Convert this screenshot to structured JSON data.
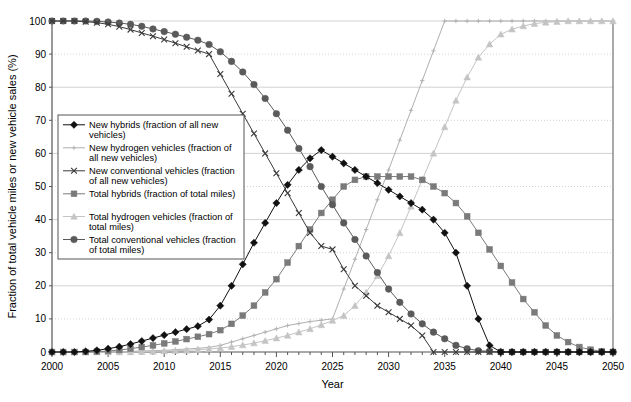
{
  "chart_data": {
    "type": "line",
    "title": "",
    "xlabel": "Year",
    "ylabel": "Fraction of total vehicle miles or new vehicle sales (%)",
    "xlim": [
      2000,
      2050
    ],
    "ylim": [
      0,
      100
    ],
    "xticks": [
      2000,
      2005,
      2010,
      2015,
      2020,
      2025,
      2030,
      2035,
      2040,
      2045,
      2050
    ],
    "yticks": [
      0,
      10,
      20,
      30,
      40,
      50,
      60,
      70,
      80,
      90,
      100
    ],
    "grid": true,
    "legend_position": "upper-left-inside",
    "x": [
      2000,
      2001,
      2002,
      2003,
      2004,
      2005,
      2006,
      2007,
      2008,
      2009,
      2010,
      2011,
      2012,
      2013,
      2014,
      2015,
      2016,
      2017,
      2018,
      2019,
      2020,
      2021,
      2022,
      2023,
      2024,
      2025,
      2026,
      2027,
      2028,
      2029,
      2030,
      2031,
      2032,
      2033,
      2034,
      2035,
      2036,
      2037,
      2038,
      2039,
      2040,
      2041,
      2042,
      2043,
      2044,
      2045,
      2046,
      2047,
      2048,
      2049,
      2050
    ],
    "series": [
      {
        "name": "New hybrids (fraction of all new vehicles)",
        "key": "new_hybrids",
        "marker": "diamond",
        "color": "#111111",
        "values": [
          0,
          0,
          0,
          0.2,
          0.5,
          1,
          1.6,
          2.4,
          3.3,
          4.2,
          5.1,
          6,
          6.9,
          7.8,
          9.8,
          14,
          20,
          26.5,
          33,
          39,
          45,
          50.5,
          55,
          58.5,
          61,
          59,
          57,
          55,
          53,
          51,
          49,
          47,
          45,
          43,
          40,
          36,
          30,
          20,
          10,
          2,
          0,
          0,
          0,
          0,
          0,
          0,
          0,
          0,
          0,
          0,
          0
        ]
      },
      {
        "name": "New hydrogen vehicles (fraction of all new vehicles)",
        "key": "new_hydrogen",
        "marker": "dot",
        "color": "#b0b0b0",
        "values": [
          0,
          0,
          0,
          0,
          0,
          0,
          0.1,
          0.2,
          0.3,
          0.4,
          0.5,
          0.7,
          0.9,
          1.1,
          1.4,
          2,
          3,
          4,
          5,
          6,
          7,
          8,
          8.6,
          9.2,
          9.6,
          10,
          19,
          28,
          37,
          46,
          55,
          64,
          73,
          82,
          91,
          100,
          100,
          100,
          100,
          100,
          100,
          100,
          100,
          100,
          100,
          100,
          100,
          100,
          100,
          100,
          100
        ]
      },
      {
        "name": "New conventional vehicles (fraction of all new vehicles)",
        "key": "new_conventional",
        "marker": "x",
        "color": "#3a3a3a",
        "values": [
          100,
          100,
          100,
          99.8,
          99.5,
          99,
          98.3,
          97.4,
          96.4,
          95.4,
          94.4,
          93.3,
          92.2,
          91.1,
          90,
          84,
          78,
          72,
          66,
          60,
          54,
          48,
          42,
          36,
          32,
          31,
          25,
          20,
          17,
          14,
          12,
          10,
          8,
          5,
          0,
          0,
          0,
          0,
          0,
          0,
          0,
          0,
          0,
          0,
          0,
          0,
          0,
          0,
          0,
          0,
          0
        ]
      },
      {
        "name": "Total hybrids (fraction of total miles)",
        "key": "total_hybrids",
        "marker": "square",
        "color": "#7a7a7a",
        "values": [
          0,
          0,
          0,
          0,
          0.1,
          0.3,
          0.6,
          1,
          1.5,
          2,
          2.6,
          3.2,
          3.9,
          4.6,
          5.4,
          6.6,
          8.5,
          11,
          14,
          18,
          22,
          27,
          32,
          37,
          42,
          46,
          50,
          52,
          53,
          53,
          53,
          53,
          53,
          52,
          50,
          48,
          45,
          41,
          36,
          31,
          26,
          21,
          16,
          12,
          8,
          5,
          3,
          1.5,
          0.7,
          0.2,
          0
        ]
      },
      {
        "name": "Total hydrogen vehicles (fraction of total miles)",
        "key": "total_hydrogen",
        "marker": "triangle",
        "color": "#c4c4c4",
        "values": [
          0,
          0,
          0,
          0,
          0,
          0,
          0,
          0,
          0.1,
          0.2,
          0.3,
          0.4,
          0.5,
          0.7,
          0.9,
          1.2,
          1.6,
          2.1,
          2.7,
          3.4,
          4.2,
          5,
          6,
          7,
          8.2,
          9.5,
          11,
          14,
          18,
          23,
          29,
          36,
          44,
          52,
          60,
          68,
          76,
          83,
          89,
          93,
          96,
          97.5,
          98.5,
          99.2,
          99.6,
          99.8,
          100,
          100,
          100,
          100,
          100
        ]
      },
      {
        "name": "Total conventional vehicles (fraction of total miles)",
        "key": "total_conventional",
        "marker": "circle",
        "color": "#5a5a5a",
        "values": [
          100,
          100,
          100,
          100,
          99.9,
          99.7,
          99.4,
          99,
          98.4,
          97.6,
          96.8,
          96,
          95.1,
          94.2,
          92.9,
          90.7,
          87.8,
          84.6,
          80.8,
          76.6,
          72,
          67,
          61.5,
          56,
          50,
          44.5,
          39,
          34,
          29,
          24,
          19,
          15,
          11.5,
          8.5,
          6,
          4,
          2,
          1,
          0.4,
          0.2,
          0,
          0,
          0,
          0,
          0,
          0,
          0,
          0,
          0,
          0,
          0
        ]
      }
    ]
  },
  "axes": {
    "y_title": "Fraction of total vehicle miles or new vehicle sales (%)",
    "x_title": "Year",
    "y_tick_labels": [
      "0",
      "10",
      "20",
      "30",
      "40",
      "50",
      "60",
      "70",
      "80",
      "90",
      "100"
    ],
    "x_tick_labels": [
      "2000",
      "2005",
      "2010",
      "2015",
      "2020",
      "2025",
      "2030",
      "2035",
      "2040",
      "2045",
      "2050"
    ]
  },
  "legend": {
    "items": [
      {
        "label": "New hybrids (fraction of all new vehicles)",
        "marker": "diamond",
        "color": "#111111"
      },
      {
        "label": "New hydrogen vehicles (fraction of all new vehicles)",
        "marker": "dot",
        "color": "#b0b0b0"
      },
      {
        "label": "New conventional vehicles (fraction of all new vehicles)",
        "marker": "x",
        "color": "#3a3a3a"
      },
      {
        "label": "Total hybrids (fraction of total miles)",
        "marker": "square",
        "color": "#7a7a7a"
      },
      {
        "label": "Total hydrogen vehicles (fraction of total miles)",
        "marker": "triangle",
        "color": "#c4c4c4"
      },
      {
        "label": "Total conventional vehicles (fraction of total miles)",
        "marker": "circle",
        "color": "#5a5a5a"
      }
    ],
    "wrapped_lines": [
      [
        "New hybrids (fraction of all new",
        "vehicles)"
      ],
      [
        "New hydrogen vehicles (fraction of",
        "all new vehicles)"
      ],
      [
        "New conventional vehicles (fraction",
        "of all new vehicles)"
      ],
      [
        "Total hybrids (fraction of total miles)"
      ],
      [
        "Total hydrogen vehicles (fraction of",
        "total miles)"
      ],
      [
        "Total conventional vehicles (fraction",
        "of total miles)"
      ]
    ]
  },
  "style": {
    "grid_color": "#bfbfbf",
    "axis_color": "#555555",
    "background": "#ffffff",
    "legend_border": "#555555"
  }
}
